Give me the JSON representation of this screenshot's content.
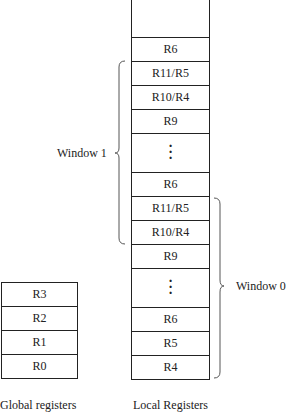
{
  "local_registers": {
    "caption": "Local Registers",
    "cells": [
      "",
      "R6",
      "R11/R5",
      "R10/R4",
      "R9",
      "⋮",
      "R6",
      "R11/R5",
      "R10/R4",
      "R9",
      "⋮",
      "R6",
      "R5",
      "R4"
    ]
  },
  "global_registers": {
    "caption": "Global registers",
    "cells": [
      "R3",
      "R2",
      "R1",
      "R0"
    ]
  },
  "windows": [
    {
      "label": "Window 1"
    },
    {
      "label": "Window 0"
    }
  ]
}
